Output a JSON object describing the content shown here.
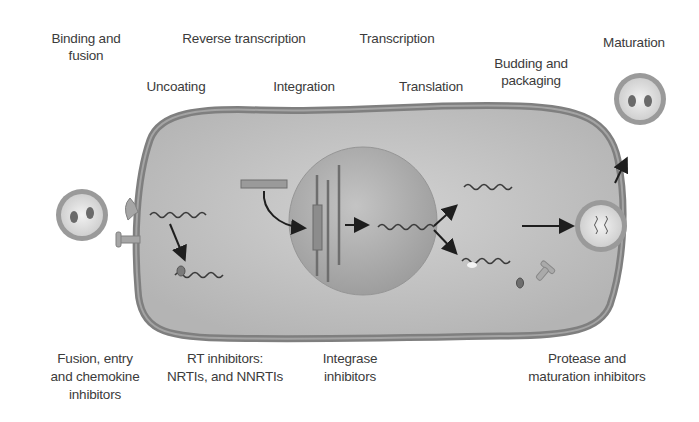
{
  "diagram": {
    "stages": [
      {
        "id": "binding",
        "line1": "Binding and",
        "line2": "fusion"
      },
      {
        "id": "reverse_transcription",
        "line1": "Reverse transcription"
      },
      {
        "id": "uncoating",
        "line1": "Uncoating"
      },
      {
        "id": "integration",
        "line1": "Integration"
      },
      {
        "id": "transcription",
        "line1": "Transcription"
      },
      {
        "id": "translation",
        "line1": "Translation"
      },
      {
        "id": "budding",
        "line1": "Budding and",
        "line2": "packaging"
      },
      {
        "id": "maturation",
        "line1": "Maturation"
      }
    ],
    "inhibitors": [
      {
        "id": "fusion_entry",
        "line1": "Fusion, entry",
        "line2": "and chemokine",
        "line3": "inhibitors"
      },
      {
        "id": "rt",
        "line1": "RT inhibitors:",
        "line2": "NRTIs, and NNRTIs"
      },
      {
        "id": "integrase",
        "line1": "Integrase",
        "line2": "inhibitors"
      },
      {
        "id": "protease",
        "line1": "Protease and",
        "line2": "maturation inhibitors"
      }
    ],
    "colors": {
      "background": "#ffffff",
      "cell_membrane": "#8c8c8c",
      "cytoplasm": "#bdbdbd",
      "nucleus": "#a9a9a9",
      "virus_envelope": "#9a9a9a",
      "virus_core": "#e8e8e8",
      "arrow": "#1e1e1e",
      "text": "#3b3b3b"
    }
  }
}
